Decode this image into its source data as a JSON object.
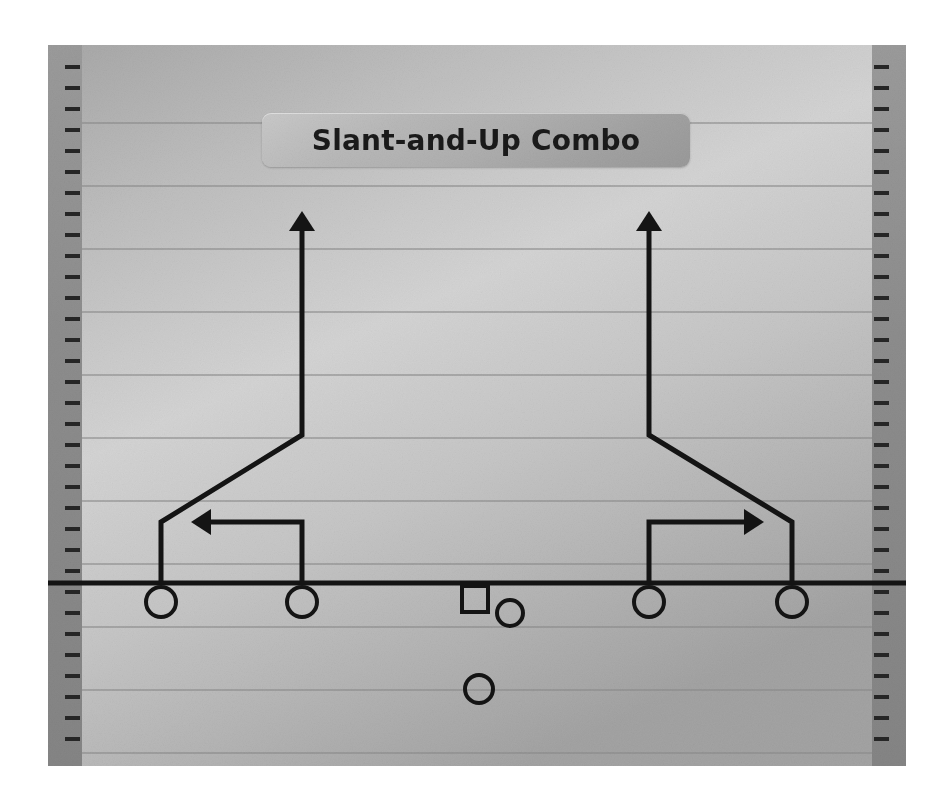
{
  "document": {
    "kind": "football-play-diagram",
    "title": "Slant-and-Up Combo"
  },
  "colors": {
    "field_light": "#d2d2d2",
    "field_dark": "#9e9e9e",
    "sideline_band": "#8e8e8e",
    "yard_line": "#8a8a8a",
    "ink": "#141414",
    "plate_light": "#c9c9c9",
    "plate_dark": "#9a9a9a",
    "page_background": "#ffffff"
  },
  "field": {
    "x": 48,
    "y": 45,
    "width": 858,
    "height": 721,
    "sideline_band_width": 34,
    "hash_tick": {
      "count": 33,
      "length": 17,
      "thickness": 4,
      "spacing": 21,
      "first_y": 22
    },
    "yard_lines_y": [
      78,
      141,
      204,
      267,
      330,
      393,
      456,
      519,
      582,
      645,
      708
    ],
    "line_of_scrimmage": {
      "y": 538,
      "thickness": 5,
      "x_start": 0,
      "x_end": 858
    }
  },
  "players": [
    {
      "id": "lt-end",
      "label": "left-outside-receiver",
      "shape": "circle",
      "cx": 113,
      "cy": 557,
      "r": 15
    },
    {
      "id": "lt-slot",
      "label": "left-inside-receiver",
      "shape": "circle",
      "cx": 254,
      "cy": 557,
      "r": 15
    },
    {
      "id": "center",
      "label": "center",
      "shape": "square",
      "cx": 427,
      "cy": 554,
      "r": 13
    },
    {
      "id": "qb",
      "label": "quarterback",
      "shape": "circle",
      "cx": 462,
      "cy": 568,
      "r": 13
    },
    {
      "id": "rt-slot",
      "label": "right-inside-receiver",
      "shape": "circle",
      "cx": 601,
      "cy": 557,
      "r": 15
    },
    {
      "id": "rt-end",
      "label": "right-outside-receiver",
      "shape": "circle",
      "cx": 744,
      "cy": 557,
      "r": 15
    },
    {
      "id": "rb",
      "label": "running-back",
      "shape": "circle",
      "cx": 431,
      "cy": 644,
      "r": 14
    }
  ],
  "routes": [
    {
      "id": "left-up",
      "label": "left-outside-slant-and-up",
      "stroke": 5,
      "arrow": "up",
      "points": [
        [
          113,
          538
        ],
        [
          113,
          477
        ],
        [
          254,
          390
        ],
        [
          254,
          185
        ]
      ]
    },
    {
      "id": "left-in",
      "label": "left-inside-drag-left",
      "stroke": 5,
      "arrow": "left",
      "points": [
        [
          254,
          538
        ],
        [
          254,
          477
        ],
        [
          162,
          477
        ]
      ]
    },
    {
      "id": "right-up",
      "label": "right-outside-slant-and-up",
      "stroke": 5,
      "arrow": "up",
      "points": [
        [
          744,
          538
        ],
        [
          744,
          477
        ],
        [
          601,
          390
        ],
        [
          601,
          185
        ]
      ]
    },
    {
      "id": "right-in",
      "label": "right-inside-drag-right",
      "stroke": 5,
      "arrow": "right",
      "points": [
        [
          601,
          538
        ],
        [
          601,
          477
        ],
        [
          697,
          477
        ]
      ]
    }
  ],
  "arrowhead": {
    "half_width": 13,
    "length": 19
  }
}
